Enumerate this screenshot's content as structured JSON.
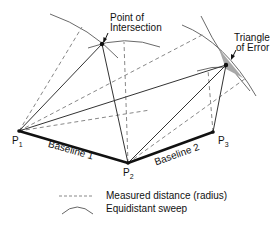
{
  "diagram": {
    "points": [
      {
        "id": "P1",
        "label": "P",
        "sub": "1",
        "x": 19,
        "y": 131
      },
      {
        "id": "P2",
        "label": "P",
        "sub": "2",
        "x": 128,
        "y": 163
      },
      {
        "id": "P3",
        "label": "P",
        "sub": "3",
        "x": 213,
        "y": 132
      }
    ],
    "baselines": [
      {
        "label": "Baseline 1",
        "from": "P1",
        "to": "P2"
      },
      {
        "label": "Baseline 2",
        "from": "P2",
        "to": "P3"
      }
    ],
    "annotations": {
      "intersection_line1": "Point of",
      "intersection_line2": "Intersection",
      "error_line1": "Triangle",
      "error_line2": "of Error"
    },
    "legend": {
      "dashed_label": "Measured distance (radius)",
      "arc_label": "Equidistant sweep"
    },
    "colors": {
      "line": "#333333",
      "dashed": "#888888",
      "arc": "#666666",
      "triangle_fill": "#a8a8a8"
    }
  }
}
